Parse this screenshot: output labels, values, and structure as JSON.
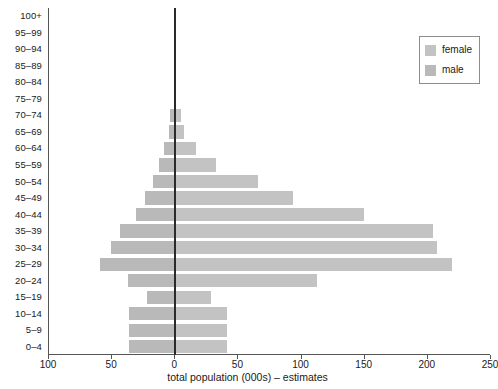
{
  "chart_data": {
    "type": "bar",
    "subtype": "population-pyramid",
    "title": "",
    "xlabel": "total population (000s) – estimates",
    "ylabel": "",
    "categories": [
      "0–4",
      "5–9",
      "10–14",
      "15–19",
      "20–24",
      "25–29",
      "30–34",
      "35–39",
      "40–44",
      "45–49",
      "50–54",
      "55–59",
      "60–64",
      "65–69",
      "70–74",
      "75–79",
      "80–84",
      "85–89",
      "90–94",
      "95–99",
      "100+"
    ],
    "series": [
      {
        "name": "male",
        "color": "#b9b9b9",
        "side": "left",
        "values": [
          36,
          36,
          36,
          22,
          37,
          59,
          50,
          43,
          30,
          23,
          17,
          12,
          8,
          4,
          3,
          0,
          0,
          0,
          0,
          0,
          0
        ]
      },
      {
        "name": "female",
        "color": "#c3c3c3",
        "side": "right",
        "values": [
          42,
          42,
          42,
          29,
          113,
          220,
          208,
          205,
          150,
          94,
          66,
          33,
          17,
          8,
          5,
          0,
          0,
          0,
          0,
          0,
          0
        ]
      }
    ],
    "xticks": [
      100,
      50,
      0,
      50,
      100,
      150,
      200,
      250
    ],
    "xtick_labels": [
      "100",
      "50",
      "0",
      "50",
      "100",
      "150",
      "200",
      "250"
    ],
    "xlim_left": 100,
    "xlim_right": 250,
    "grid": false,
    "legend_position": "top-right",
    "legend": [
      "female",
      "male"
    ],
    "zero_line_color": "#2b2b2b",
    "axis_color": "#555555"
  },
  "legend": {
    "items": [
      {
        "label": "female",
        "color": "#c3c3c3"
      },
      {
        "label": "male",
        "color": "#b9b9b9"
      }
    ]
  },
  "axis": {
    "x_title": "total population (000s) – estimates"
  }
}
